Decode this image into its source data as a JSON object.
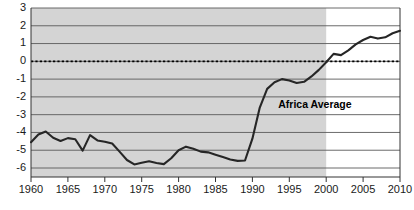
{
  "chart_data": {
    "type": "line",
    "title": "",
    "subtitle": "",
    "xlabel": "",
    "ylabel": "",
    "xlim": [
      1960,
      2010
    ],
    "ylim": [
      -6,
      3
    ],
    "grid": true,
    "legend_position": "inline-annotation",
    "annotations": [
      {
        "text": "Africa Average",
        "x": 1993.5,
        "y": -2.45
      }
    ],
    "zero_reference_line": {
      "value": 0,
      "style": "dotted"
    },
    "shaded_region": {
      "x_start": 1960,
      "x_end": 2000,
      "color": "#d4d4d4"
    },
    "y_ticks": [
      3,
      2,
      1,
      0,
      -1,
      -2,
      -3,
      -4,
      -5,
      -6
    ],
    "y_tick_labels": [
      "3",
      "2",
      "1",
      "0",
      "-1",
      "-2",
      "-3",
      "-4",
      "-5",
      "-6"
    ],
    "x_ticks": [
      1960,
      1965,
      1970,
      1975,
      1980,
      1985,
      1990,
      1995,
      2000,
      2005,
      2010
    ],
    "x_tick_labels": [
      "1960",
      "1965",
      "1970",
      "1975",
      "1980",
      "1985",
      "1990",
      "1995",
      "2000",
      "2005",
      "2010"
    ],
    "series": [
      {
        "name": "Africa Average",
        "color": "#262626",
        "x": [
          1960,
          1961,
          1962,
          1963,
          1964,
          1965,
          1966,
          1967,
          1968,
          1969,
          1970,
          1971,
          1972,
          1973,
          1974,
          1975,
          1976,
          1977,
          1978,
          1979,
          1980,
          1981,
          1982,
          1983,
          1984,
          1985,
          1986,
          1987,
          1988,
          1989,
          1990,
          1991,
          1992,
          1993,
          1994,
          1995,
          1996,
          1997,
          1998,
          1999,
          2000,
          2001,
          2002,
          2003,
          2004,
          2005,
          2006,
          2007,
          2008,
          2009,
          2010
        ],
        "values": [
          -4.55,
          -4.12,
          -3.95,
          -4.3,
          -4.48,
          -4.32,
          -4.38,
          -5.02,
          -4.15,
          -4.45,
          -4.52,
          -4.62,
          -5.08,
          -5.55,
          -5.8,
          -5.7,
          -5.62,
          -5.72,
          -5.78,
          -5.45,
          -5.0,
          -4.8,
          -4.92,
          -5.08,
          -5.12,
          -5.25,
          -5.38,
          -5.52,
          -5.6,
          -5.58,
          -4.35,
          -2.6,
          -1.55,
          -1.18,
          -1.0,
          -1.08,
          -1.22,
          -1.15,
          -0.85,
          -0.48,
          -0.05,
          0.42,
          0.35,
          0.62,
          0.95,
          1.2,
          1.38,
          1.28,
          1.35,
          1.58,
          1.72
        ]
      }
    ]
  }
}
